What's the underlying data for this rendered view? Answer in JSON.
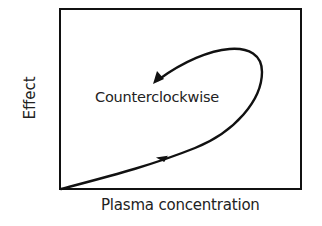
{
  "diagram": {
    "type": "hysteresis-loop",
    "loop_label": "Counterclockwise",
    "x_axis_label": "Plasma concentration",
    "y_axis_label": "Effect",
    "curve_color": "#111111",
    "frame_color": "#111111",
    "direction": "counterclockwise"
  }
}
